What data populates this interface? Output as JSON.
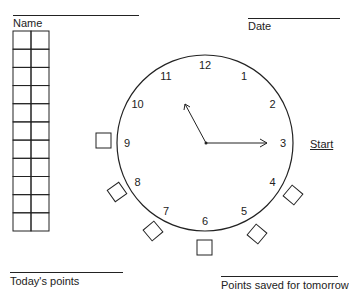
{
  "header": {
    "name_label": "Name",
    "date_label": "Date"
  },
  "points_grid": {
    "columns": 2,
    "rows": 11
  },
  "clock": {
    "numbers": [
      "12",
      "1",
      "2",
      "3",
      "4",
      "5",
      "6",
      "7",
      "8",
      "9",
      "10",
      "11"
    ],
    "hour_hand_points_to": "11",
    "minute_hand_points_to": "3",
    "start_label": "Start",
    "checkbox_positions": [
      "9",
      "8",
      "7",
      "6",
      "5",
      "4"
    ]
  },
  "footer": {
    "todays_points_label": "Today's points",
    "saved_points_label": "Points saved for tomorrow"
  }
}
